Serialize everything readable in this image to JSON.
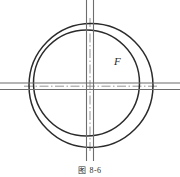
{
  "figure": {
    "caption": "图 8-6",
    "title_label": "F",
    "background_color": "#ffffff",
    "line_color": "#2b2b2b",
    "centerline_color": "#7a7a7a",
    "width": 180,
    "height": 177
  },
  "geometry": {
    "outer_circle": {
      "name": "outer-circle",
      "cx": 91,
      "cy": 85.5,
      "r": 62,
      "stroke_width": 1.5
    },
    "inner_circle": {
      "name": "inner-circle",
      "cx": 86.5,
      "cy": 83,
      "r": 53,
      "stroke_width": 1.5
    },
    "vertical_lines": [
      {
        "name": "vertical-line-left",
        "x": 86.5,
        "y1": 0,
        "y2": 161
      },
      {
        "name": "vertical-line-right",
        "x": 93.5,
        "y1": 0,
        "y2": 161
      }
    ],
    "horizontal_lines": [
      {
        "name": "horizontal-line-top",
        "y": 83,
        "x1": 0,
        "x2": 180
      },
      {
        "name": "horizontal-line-bottom",
        "y": 89.5,
        "x1": 0,
        "x2": 180
      }
    ],
    "center_lines": [
      {
        "name": "centerline-vertical",
        "x": 90,
        "y1": 18,
        "y2": 152
      },
      {
        "name": "centerline-horizontal",
        "y": 86.2,
        "x1": 24,
        "x2": 158
      }
    ],
    "label_F_position": {
      "x": 114,
      "y": 56
    }
  }
}
